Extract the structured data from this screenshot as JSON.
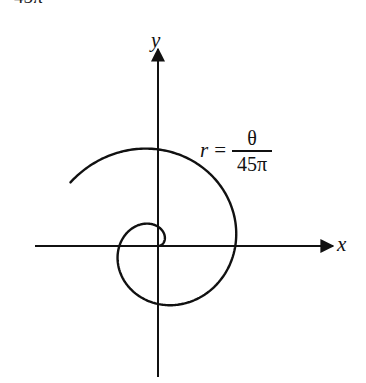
{
  "header_fragment": "45π",
  "axes": {
    "x_label": "x",
    "y_label": "y",
    "origin": [
      158,
      246
    ],
    "x_range_px": [
      35,
      333
    ],
    "y_range_px": [
      49,
      377
    ],
    "stroke": "#111111"
  },
  "curve": {
    "type": "archimedean-spiral",
    "equation": {
      "lhs": "r",
      "equals": "=",
      "numerator": "θ",
      "denominator": "45π"
    },
    "scale_px_per_rad": 12.3,
    "theta_start": 0,
    "theta_end_pi": 2.8,
    "stroke": "#111111",
    "stroke_width": 2.4
  }
}
